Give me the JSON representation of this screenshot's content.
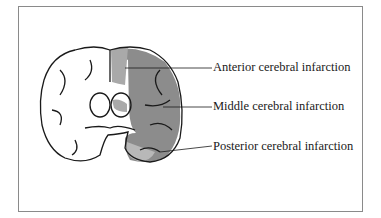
{
  "diagram": {
    "labels": [
      {
        "text": "Anterior cerebral infarction"
      },
      {
        "text": "Middle cerebral infarction"
      },
      {
        "text": "Posterior cerebral infarction"
      }
    ],
    "colors": {
      "frame": "#8a8a8a",
      "anterior": "#a9a9a9",
      "middle": "#8c8c8c",
      "posterior": "#b8b8b8",
      "outline": "#1a1a1a"
    }
  }
}
